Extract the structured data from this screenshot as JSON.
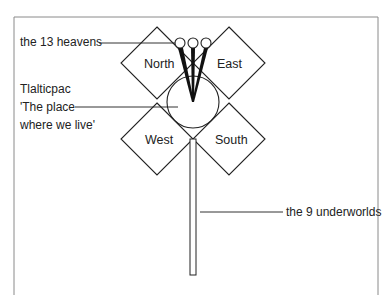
{
  "diagram": {
    "labels": {
      "heavens": "the 13 heavens",
      "tlalticpac_line1": "Tlalticpac",
      "tlalticpac_line2": "'The place",
      "tlalticpac_line3": "where we live'",
      "underworlds": "the 9 underworlds"
    },
    "directions": {
      "north": "North",
      "east": "East",
      "west": "West",
      "south": "South"
    },
    "colors": {
      "stroke": "#222222",
      "frame": "#777777",
      "background": "#ffffff"
    }
  }
}
